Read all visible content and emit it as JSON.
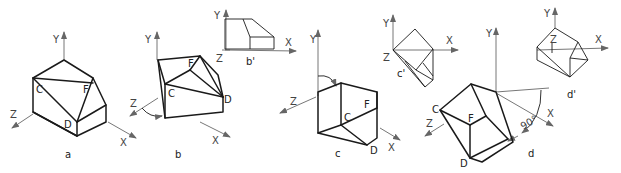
{
  "figures": {
    "a": {
      "caption": "a",
      "axes": {
        "y": "Y",
        "z": "Z",
        "x": "X"
      },
      "points": {
        "c": "C",
        "f": "F",
        "d": "D"
      }
    },
    "b": {
      "caption": "b",
      "axes": {
        "y": "Y",
        "z": "Z",
        "x": "X"
      },
      "points": {
        "c": "C",
        "f": "F",
        "d": "D"
      }
    },
    "b_prime": {
      "caption": "b'",
      "axes": {
        "y": "Y",
        "z": "Z",
        "x": "X"
      }
    },
    "c": {
      "caption": "c",
      "axes": {
        "y": "Y",
        "z": "Z",
        "x": "X"
      },
      "points": {
        "c": "C",
        "f": "F",
        "d": "D"
      }
    },
    "c_prime": {
      "caption": "c'",
      "axes": {
        "y": "Y",
        "z": "Z",
        "x": "X"
      }
    },
    "d": {
      "caption": "d",
      "axes": {
        "y": "Y",
        "z": "Z",
        "x": "X"
      },
      "points": {
        "c": "C",
        "f": "F",
        "d": "D"
      },
      "angle": "90°"
    },
    "d_prime": {
      "caption": "d'",
      "axes": {
        "y": "Y",
        "z": "Z",
        "x": "X"
      }
    }
  }
}
